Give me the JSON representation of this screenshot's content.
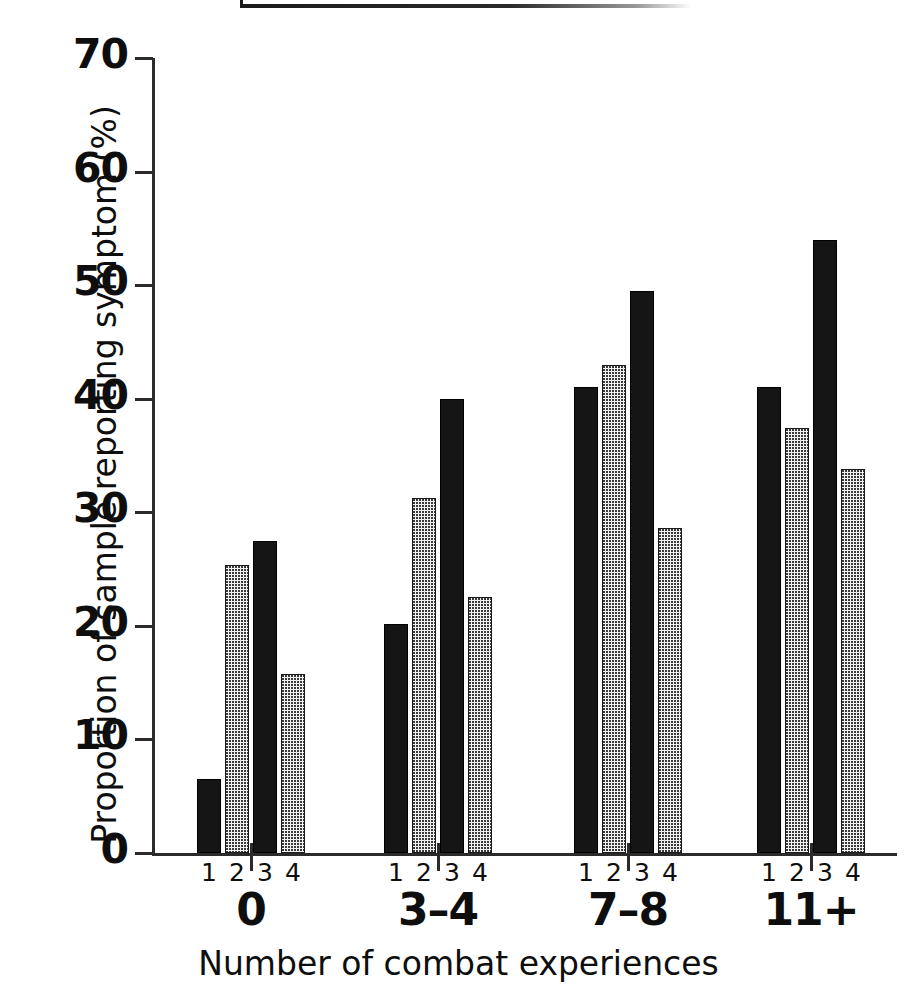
{
  "chart_data": {
    "type": "bar",
    "title": "",
    "xlabel": "Number of combat experiences",
    "ylabel": "Proportion of sample reporting symptom (%)",
    "categories": [
      "0",
      "3–4",
      "7–8",
      "11+"
    ],
    "subcategory_labels": [
      "1",
      "2",
      "3",
      "4"
    ],
    "ylim": [
      0,
      70
    ],
    "ytick_labels": [
      "70",
      "60",
      "50",
      "40",
      "30",
      "20",
      "10",
      "0"
    ],
    "ytick_values": [
      70,
      60,
      50,
      40,
      30,
      20,
      10,
      0
    ],
    "grid": false,
    "legend_position": "top (cropped out of view)",
    "series": [
      {
        "name": "1",
        "fill": "solid-black",
        "values": [
          6.5,
          20.2,
          41.0,
          41.0
        ]
      },
      {
        "name": "2",
        "fill": "stipple-light",
        "values": [
          25.4,
          31.3,
          43.0,
          37.4
        ]
      },
      {
        "name": "3",
        "fill": "solid-black",
        "values": [
          27.5,
          40.0,
          49.5,
          54.0
        ]
      },
      {
        "name": "4",
        "fill": "stipple-light",
        "values": [
          15.8,
          22.5,
          28.6,
          33.8
        ]
      }
    ],
    "colors": {
      "solid_bar": "#151515",
      "stipple_bar_base": "#f2f2f2",
      "stipple_dot": "#3a3a3a",
      "axis": "#2b2b2b",
      "text": "#0e0e0e",
      "background": "#ffffff"
    }
  }
}
